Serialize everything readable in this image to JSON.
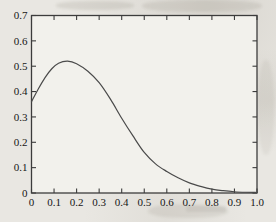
{
  "figure": {
    "page_bg": "#e9e7e2",
    "plot_bg": "#f2f1ec",
    "axis_color": "#3c3c3c",
    "curve_color": "#4a4a4a",
    "label_color": "#161616"
  },
  "chart_data": {
    "type": "line",
    "title": "",
    "xlabel": "",
    "ylabel": "",
    "xlim": [
      0,
      1.0
    ],
    "ylim": [
      0,
      0.7
    ],
    "grid": false,
    "legend": "none",
    "tick_style": "inward-all-four-spines",
    "x_ticks": [
      0,
      0.1,
      0.2,
      0.3,
      0.4,
      0.5,
      0.6,
      0.7,
      0.8,
      0.9,
      1.0
    ],
    "x_tick_labels": [
      "0",
      "0.1",
      "0.2",
      "0.3",
      "0.4",
      "0.5",
      "0.6",
      "0.7",
      "0.8",
      "0.9",
      "1.0"
    ],
    "y_ticks": [
      0,
      0.1,
      0.2,
      0.3,
      0.4,
      0.5,
      0.6,
      0.7
    ],
    "y_tick_labels": [
      "0",
      "0.1",
      "0.2",
      "0.3",
      "0.4",
      "0.5",
      "0.6",
      "0.7"
    ],
    "series": [
      {
        "name": "bell-shaped-density-curve",
        "x": [
          0.0,
          0.03,
          0.06,
          0.09,
          0.12,
          0.16,
          0.2,
          0.25,
          0.3,
          0.35,
          0.4,
          0.45,
          0.5,
          0.55,
          0.6,
          0.65,
          0.7,
          0.75,
          0.8,
          0.85,
          0.9,
          0.95,
          1.0
        ],
        "y": [
          0.36,
          0.41,
          0.455,
          0.49,
          0.512,
          0.52,
          0.51,
          0.48,
          0.435,
          0.37,
          0.295,
          0.225,
          0.16,
          0.115,
          0.085,
          0.06,
          0.04,
          0.026,
          0.015,
          0.009,
          0.005,
          0.003,
          0.002
        ]
      }
    ]
  }
}
